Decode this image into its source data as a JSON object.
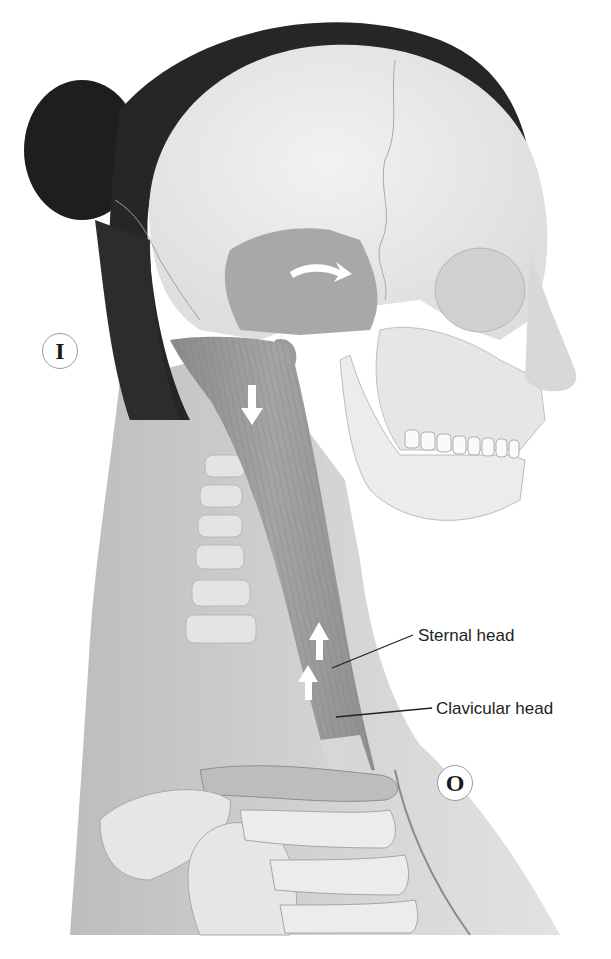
{
  "figure": {
    "labels": [
      {
        "id": "sternal-head",
        "text": "Sternal head"
      },
      {
        "id": "clavicular-head",
        "text": "Clavicular head"
      }
    ],
    "markers": [
      {
        "id": "insertion",
        "text": "I"
      },
      {
        "id": "origin",
        "text": "O"
      }
    ],
    "arrows": [
      {
        "id": "rotation-arrow",
        "direction": "curved-right",
        "location": "temporal region"
      },
      {
        "id": "down-arrow",
        "direction": "down",
        "location": "upper muscle belly"
      },
      {
        "id": "up-arrow-upper",
        "direction": "up",
        "location": "sternal head"
      },
      {
        "id": "up-arrow-lower",
        "direction": "up",
        "location": "clavicular head"
      }
    ],
    "colors": {
      "background": "#ffffff",
      "hair": "#1e1e1e",
      "skull": "#ececec",
      "skin": "#d4d4d4",
      "muscle": "#9c9c9c",
      "text": "#222222",
      "marker_border": "#9a9a9a"
    }
  }
}
